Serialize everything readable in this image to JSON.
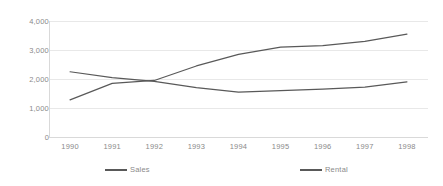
{
  "chart_data": {
    "type": "line",
    "title": "",
    "subtitle": "",
    "xlabel": "",
    "ylabel": "",
    "categories": [
      "1990",
      "1991",
      "1992",
      "1993",
      "1994",
      "1995",
      "1996",
      "1997",
      "1998"
    ],
    "series": [
      {
        "name": "Sales",
        "color": "#595959",
        "values": [
          1280,
          1850,
          1950,
          2450,
          2850,
          3100,
          3150,
          3300,
          3550
        ]
      },
      {
        "name": "Rental",
        "color": "#595959",
        "values": [
          2250,
          2050,
          1920,
          1700,
          1550,
          1600,
          1650,
          1720,
          1900
        ]
      }
    ],
    "ylim": [
      0,
      4000
    ],
    "ytick_values": [
      0,
      1000,
      2000,
      3000,
      4000
    ],
    "ytick_labels": [
      "0",
      "1,000",
      "2,000",
      "3,000",
      "4,000"
    ],
    "grid": true,
    "grid_axis": "y",
    "grid_color": "#e8e8e8",
    "legend": true,
    "legend_position": "bottom",
    "legend_entries": [
      "Sales",
      "Rental"
    ],
    "axis_color": "#d9d9d9",
    "tick_label_color": "#8a8a8a",
    "background": "#ffffff"
  }
}
